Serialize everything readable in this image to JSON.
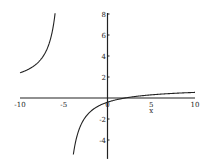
{
  "chart_data": {
    "type": "line",
    "title": "",
    "xlabel": "x",
    "ylabel": "",
    "xlim": [
      -10,
      10
    ],
    "ylim": [
      -5,
      8
    ],
    "grid": false,
    "legend": null,
    "x_ticks": [
      "-10",
      "-5",
      "0",
      "5",
      "10"
    ],
    "y_ticks": [
      "8",
      "6",
      "4",
      "2",
      "-2",
      "-4"
    ],
    "series": [
      {
        "name": "rational function",
        "description": "approx. y = (x-2)/(x+5), vertical asymptote near x=-5, horizontal asymptote ~y=1",
        "x": [
          -10,
          -9,
          -8,
          -7,
          -6.2,
          -3.6,
          -3,
          -2,
          -1,
          0,
          1,
          2,
          3,
          4,
          5,
          6,
          7,
          8,
          9,
          10
        ],
        "y": [
          2.4,
          2.75,
          3.33,
          4.5,
          6.8,
          -4.0,
          -2.5,
          -1.33,
          -0.75,
          -0.4,
          -0.17,
          0,
          0.13,
          0.22,
          0.3,
          0.36,
          0.42,
          0.46,
          0.5,
          0.53
        ]
      }
    ]
  }
}
